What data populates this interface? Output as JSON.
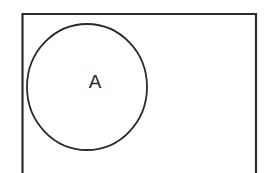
{
  "diagram": {
    "type": "venn",
    "universe": {
      "shape": "rectangle",
      "label": ""
    },
    "sets": [
      {
        "label": "A",
        "shape": "circle"
      }
    ],
    "colors": {
      "stroke": "#2b2b2b",
      "background": "#ffffff"
    }
  }
}
